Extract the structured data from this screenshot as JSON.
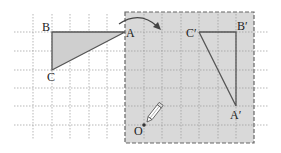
{
  "figure": {
    "labels": {
      "A": "A",
      "B": "B",
      "C": "C",
      "A_prime": "A′",
      "B_prime": "B′",
      "C_prime": "C′",
      "O": "O"
    },
    "colors": {
      "shaded": "#d9d9d9",
      "triangle_fill": "#cfcfcf",
      "line": "#555555",
      "grid": "#9a9a9a"
    },
    "icons": [
      "pencil-icon",
      "curved-arrow-icon"
    ]
  }
}
